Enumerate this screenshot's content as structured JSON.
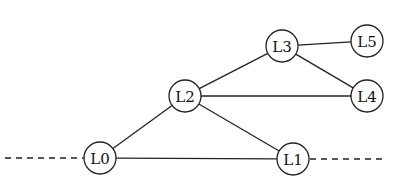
{
  "diagram": {
    "type": "graph",
    "nodes": [
      {
        "id": "L0",
        "label": "L0",
        "x": 100,
        "y": 158,
        "r": 16
      },
      {
        "id": "L1",
        "label": "L1",
        "x": 293,
        "y": 159,
        "r": 16
      },
      {
        "id": "L2",
        "label": "L2",
        "x": 185,
        "y": 96,
        "r": 16
      },
      {
        "id": "L3",
        "label": "L3",
        "x": 282,
        "y": 46,
        "r": 16
      },
      {
        "id": "L4",
        "label": "L4",
        "x": 367,
        "y": 96,
        "r": 16
      },
      {
        "id": "L5",
        "label": "L5",
        "x": 367,
        "y": 41,
        "r": 16
      }
    ],
    "edges": [
      {
        "from": "L0",
        "to": "L1",
        "style": "solid"
      },
      {
        "from": "L0",
        "to": "L2",
        "style": "solid"
      },
      {
        "from": "L2",
        "to": "L1",
        "style": "solid"
      },
      {
        "from": "L2",
        "to": "L3",
        "style": "solid"
      },
      {
        "from": "L2",
        "to": "L4",
        "style": "solid"
      },
      {
        "from": "L3",
        "to": "L4",
        "style": "solid"
      },
      {
        "from": "L3",
        "to": "L5",
        "style": "solid"
      }
    ],
    "dangling": [
      {
        "node": "L0",
        "direction": "left",
        "x_end": 5,
        "style": "dashed"
      },
      {
        "node": "L1",
        "direction": "right",
        "x_end": 382,
        "style": "dashed"
      }
    ]
  }
}
